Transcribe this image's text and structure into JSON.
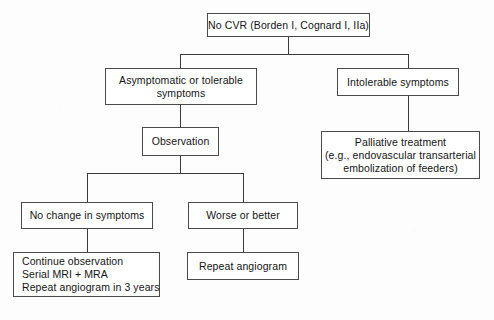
{
  "diagram": {
    "type": "flowchart",
    "orientation": "top-down",
    "background_color": "#ffffff",
    "node_border_color": "#4a4a4a",
    "connector_color": "#3a3a3a",
    "text_color": "#141414"
  },
  "nodes": {
    "root": {
      "id": "no-cvr",
      "lines": [
        "No CVR (Borden I, Cognard I, IIa)"
      ]
    },
    "asymptomatic": {
      "id": "asymptomatic-or-tolerable-symptoms",
      "lines": [
        "Asymptomatic or tolerable",
        "symptoms"
      ]
    },
    "intolerable": {
      "id": "intolerable-symptoms",
      "lines": [
        "Intolerable symptoms"
      ]
    },
    "observation": {
      "id": "observation",
      "lines": [
        "Observation"
      ]
    },
    "palliative": {
      "id": "palliative-treatment",
      "lines": [
        "Palliative treatment",
        "(e.g., endovascular transarterial",
        "embolization of feeders)"
      ]
    },
    "no_change": {
      "id": "no-change-in-symptoms",
      "lines": [
        "No change in symptoms"
      ]
    },
    "worse_or_better": {
      "id": "worse-or-better",
      "lines": [
        "Worse or better"
      ]
    },
    "continue_observation": {
      "id": "continue-observation",
      "lines": [
        "Continue observation",
        "Serial MRI + MRA",
        "Repeat angiogram in 3 years"
      ]
    },
    "repeat_angiogram": {
      "id": "repeat-angiogram",
      "lines": [
        "Repeat angiogram"
      ]
    }
  },
  "edges": [
    {
      "from": "no-cvr",
      "to": "asymptomatic-or-tolerable-symptoms"
    },
    {
      "from": "no-cvr",
      "to": "intolerable-symptoms"
    },
    {
      "from": "asymptomatic-or-tolerable-symptoms",
      "to": "observation"
    },
    {
      "from": "intolerable-symptoms",
      "to": "palliative-treatment"
    },
    {
      "from": "observation",
      "to": "no-change-in-symptoms"
    },
    {
      "from": "observation",
      "to": "worse-or-better"
    },
    {
      "from": "no-change-in-symptoms",
      "to": "continue-observation"
    },
    {
      "from": "worse-or-better",
      "to": "repeat-angiogram"
    }
  ]
}
